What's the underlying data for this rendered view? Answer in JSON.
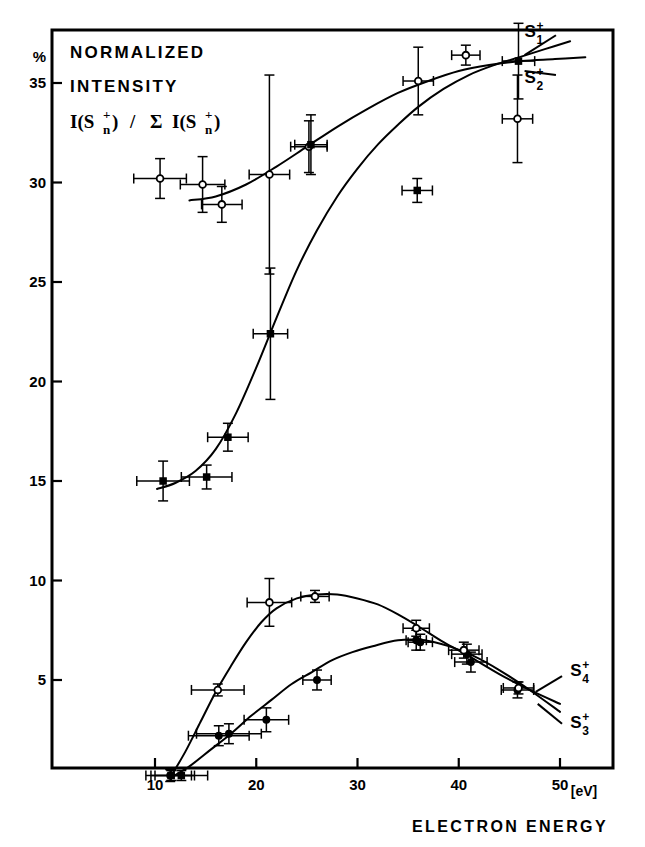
{
  "figure": {
    "heading_line1": "NORMALIZED",
    "heading_line2": "INTENSITY",
    "formula": "I(Sn+) / Σ I(Sn+)",
    "formula_parts": {
      "open": "I(S",
      "sub": "n",
      "sup": "+",
      "close": ")",
      "slash": "/",
      "sigma": "Σ"
    },
    "y_unit": "%",
    "x_unit": "[eV]",
    "x_title": "ELECTRON ENERGY"
  },
  "axes": {
    "x_ticks": [
      "10",
      "20",
      "30",
      "40",
      "50"
    ],
    "x_tick_values": [
      10,
      20,
      30,
      40,
      50
    ],
    "y_ticks": [
      "5",
      "10",
      "15",
      "20",
      "25",
      "30",
      "35"
    ],
    "y_tick_values": [
      5,
      10,
      15,
      20,
      25,
      30,
      35
    ],
    "xlim": [
      3.6,
      55.4
    ],
    "ylim": [
      -0.2,
      37.0
    ]
  },
  "chart_data": {
    "type": "scatter",
    "xlabel": "ELECTRON ENERGY [eV]",
    "ylabel": "%",
    "xlim": [
      3.6,
      55.4
    ],
    "ylim": [
      -0.2,
      37.0
    ],
    "grid": false,
    "legend": "inline-curve-labels",
    "series": [
      {
        "name": "S1+",
        "label": "S₁⁺",
        "marker": "filled-circle",
        "label_pos": {
          "x": 46.5,
          "y": 37.3
        },
        "points": [
          {
            "x": 11.5,
            "y": 0.2,
            "xerr": 2.4,
            "yerr": 0.3
          },
          {
            "x": 16.3,
            "y": 2.2,
            "xerr": 3.0,
            "yerr": 0.5
          },
          {
            "x": 17.3,
            "y": 2.3,
            "xerr": 3.2,
            "yerr": 0.5
          },
          {
            "x": 21.0,
            "y": 3.0,
            "xerr": 2.2,
            "yerr": 0.6
          },
          {
            "x": 26.0,
            "y": 5.0,
            "xerr": 1.4,
            "yerr": 0.5
          },
          {
            "x": 35.8,
            "y": 7.0,
            "xerr": 1.0,
            "yerr": 0.5
          },
          {
            "x": 36.2,
            "y": 6.9,
            "xerr": 1.2,
            "yerr": 0.4
          },
          {
            "x": 40.8,
            "y": 6.3,
            "xerr": 1.5,
            "yerr": 0.5
          },
          {
            "x": 41.2,
            "y": 5.9,
            "xerr": 1.6,
            "yerr": 0.5
          },
          {
            "x": 45.8,
            "y": 4.5,
            "xerr": 1.6,
            "yerr": 0.4
          }
        ]
      },
      {
        "name": "S2+",
        "label": "S₂⁺",
        "marker": "open-circle",
        "label_pos": {
          "x": 46.5,
          "y": 35.0
        },
        "points": [
          {
            "x": 10.5,
            "y": 30.2,
            "xerr": 2.6,
            "yerr": 1.0
          },
          {
            "x": 14.7,
            "y": 29.9,
            "xerr": 2.2,
            "yerr": 1.4
          },
          {
            "x": 16.6,
            "y": 28.9,
            "xerr": 2.0,
            "yerr": 0.9
          },
          {
            "x": 21.3,
            "y": 30.4,
            "xerr": 2.0,
            "yerr": 5.0
          },
          {
            "x": 25.2,
            "y": 31.8,
            "xerr": 1.8,
            "yerr": 1.3
          },
          {
            "x": 36.0,
            "y": 35.1,
            "xerr": 1.5,
            "yerr": 1.7
          },
          {
            "x": 40.7,
            "y": 36.4,
            "xerr": 1.4,
            "yerr": 0.5
          },
          {
            "x": 45.8,
            "y": 33.2,
            "xerr": 1.5,
            "yerr": 2.2
          }
        ]
      },
      {
        "name": "S3+",
        "label": "S₃⁺",
        "marker": "filled-square",
        "label_pos": {
          "x": 51.0,
          "y": 2.6
        },
        "points": [
          {
            "x": 11.6,
            "y": 0.2,
            "xerr": 2.0,
            "yerr": 0.25
          },
          {
            "x": 12.6,
            "y": 0.2,
            "xerr": 2.6,
            "yerr": 0.25
          },
          {
            "x": 15.1,
            "y": 15.2,
            "xerr": 2.5,
            "yerr": 0.6
          },
          {
            "x": 10.8,
            "y": 15.0,
            "xerr": 2.6,
            "yerr": 1.0
          },
          {
            "x": 17.2,
            "y": 17.2,
            "xerr": 2.0,
            "yerr": 0.7
          },
          {
            "x": 21.4,
            "y": 22.4,
            "xerr": 1.7,
            "yerr": 3.3
          },
          {
            "x": 25.4,
            "y": 31.9,
            "xerr": 1.6,
            "yerr": 1.5
          },
          {
            "x": 35.9,
            "y": 29.6,
            "xerr": 1.5,
            "yerr": 0.6
          },
          {
            "x": 45.9,
            "y": 36.1,
            "xerr": 1.6,
            "yerr": 1.9
          }
        ]
      },
      {
        "name": "S4+",
        "label": "S₄⁺",
        "marker": "open-circle",
        "label_pos": {
          "x": 51.0,
          "y": 5.2
        },
        "points": [
          {
            "x": 16.2,
            "y": 4.5,
            "xerr": 2.6,
            "yerr": 0.3
          },
          {
            "x": 21.3,
            "y": 8.9,
            "xerr": 2.2,
            "yerr": 1.2
          },
          {
            "x": 25.8,
            "y": 9.2,
            "xerr": 1.4,
            "yerr": 0.3
          },
          {
            "x": 35.8,
            "y": 7.6,
            "xerr": 1.3,
            "yerr": 0.4
          },
          {
            "x": 40.5,
            "y": 6.5,
            "xerr": 1.5,
            "yerr": 0.4
          },
          {
            "x": 45.9,
            "y": 4.6,
            "xerr": 1.5,
            "yerr": 0.3
          }
        ]
      }
    ],
    "curves": [
      {
        "name": "S2+-upper-curve",
        "note": "upper saturating curve rising 29 -> 36.5",
        "path": [
          {
            "x": 13.4,
            "y": 29.1
          },
          {
            "x": 16.0,
            "y": 29.3
          },
          {
            "x": 19.0,
            "y": 29.9
          },
          {
            "x": 22.0,
            "y": 30.8
          },
          {
            "x": 25.0,
            "y": 31.8
          },
          {
            "x": 28.0,
            "y": 32.8
          },
          {
            "x": 31.0,
            "y": 33.7
          },
          {
            "x": 34.0,
            "y": 34.5
          },
          {
            "x": 37.0,
            "y": 35.1
          },
          {
            "x": 40.0,
            "y": 35.6
          },
          {
            "x": 43.0,
            "y": 35.9
          },
          {
            "x": 46.2,
            "y": 36.1
          },
          {
            "x": 49.5,
            "y": 36.2
          },
          {
            "x": 52.5,
            "y": 36.3
          }
        ]
      },
      {
        "name": "S1+-sigmoid-curve",
        "note": "sigmoid rising 14.8 -> past 36 crossing at ~46 eV",
        "path": [
          {
            "x": 10.2,
            "y": 14.6
          },
          {
            "x": 12.0,
            "y": 14.9
          },
          {
            "x": 14.0,
            "y": 15.5
          },
          {
            "x": 16.0,
            "y": 16.6
          },
          {
            "x": 18.0,
            "y": 18.4
          },
          {
            "x": 20.0,
            "y": 20.7
          },
          {
            "x": 22.0,
            "y": 23.2
          },
          {
            "x": 24.0,
            "y": 25.6
          },
          {
            "x": 26.0,
            "y": 27.6
          },
          {
            "x": 28.0,
            "y": 29.3
          },
          {
            "x": 30.0,
            "y": 30.7
          },
          {
            "x": 32.0,
            "y": 31.9
          },
          {
            "x": 34.0,
            "y": 32.9
          },
          {
            "x": 36.0,
            "y": 33.8
          },
          {
            "x": 38.5,
            "y": 34.7
          },
          {
            "x": 41.0,
            "y": 35.4
          },
          {
            "x": 43.5,
            "y": 35.9
          },
          {
            "x": 46.0,
            "y": 36.3
          },
          {
            "x": 48.5,
            "y": 36.7
          },
          {
            "x": 51.0,
            "y": 37.1
          }
        ]
      },
      {
        "name": "S4+-hump-curve",
        "note": "lower hump peaking ~9.3 at 27 eV",
        "path": [
          {
            "x": 11.5,
            "y": 0.1
          },
          {
            "x": 13.0,
            "y": 1.4
          },
          {
            "x": 14.5,
            "y": 2.9
          },
          {
            "x": 16.0,
            "y": 4.4
          },
          {
            "x": 17.5,
            "y": 5.7
          },
          {
            "x": 19.0,
            "y": 6.9
          },
          {
            "x": 20.5,
            "y": 7.9
          },
          {
            "x": 22.0,
            "y": 8.6
          },
          {
            "x": 24.0,
            "y": 9.1
          },
          {
            "x": 26.0,
            "y": 9.3
          },
          {
            "x": 28.0,
            "y": 9.3
          },
          {
            "x": 30.0,
            "y": 9.1
          },
          {
            "x": 32.0,
            "y": 8.8
          },
          {
            "x": 34.0,
            "y": 8.3
          },
          {
            "x": 36.0,
            "y": 7.7
          },
          {
            "x": 38.5,
            "y": 6.9
          },
          {
            "x": 41.0,
            "y": 6.2
          },
          {
            "x": 44.0,
            "y": 5.3
          },
          {
            "x": 47.0,
            "y": 4.5
          },
          {
            "x": 50.0,
            "y": 3.8
          }
        ]
      },
      {
        "name": "S3+-hump-curve",
        "note": "lowest hump peaking ~7.0 at 35 eV",
        "path": [
          {
            "x": 11.6,
            "y": 0.1
          },
          {
            "x": 13.5,
            "y": 0.7
          },
          {
            "x": 15.5,
            "y": 1.5
          },
          {
            "x": 17.5,
            "y": 2.3
          },
          {
            "x": 19.5,
            "y": 3.2
          },
          {
            "x": 21.5,
            "y": 4.0
          },
          {
            "x": 23.5,
            "y": 4.8
          },
          {
            "x": 25.5,
            "y": 5.4
          },
          {
            "x": 27.5,
            "y": 6.0
          },
          {
            "x": 29.5,
            "y": 6.4
          },
          {
            "x": 31.5,
            "y": 6.7
          },
          {
            "x": 34.0,
            "y": 7.0
          },
          {
            "x": 36.5,
            "y": 7.0
          },
          {
            "x": 39.0,
            "y": 6.7
          },
          {
            "x": 41.5,
            "y": 6.2
          },
          {
            "x": 44.0,
            "y": 5.5
          },
          {
            "x": 47.0,
            "y": 4.5
          },
          {
            "x": 50.0,
            "y": 3.4
          }
        ]
      }
    ],
    "leaders": [
      {
        "name": "S1+-leader",
        "from": {
          "x": 46.5,
          "y": 36.4
        },
        "to": {
          "x": 49.6,
          "y": 37.4
        }
      },
      {
        "name": "S2+-leader",
        "from": {
          "x": 46.5,
          "y": 35.6
        },
        "to": {
          "x": 49.6,
          "y": 35.4
        }
      },
      {
        "name": "S4+-leader",
        "from": {
          "x": 47.6,
          "y": 4.4
        },
        "to": {
          "x": 50.2,
          "y": 5.2
        }
      },
      {
        "name": "S3+-leader",
        "from": {
          "x": 47.8,
          "y": 3.8
        },
        "to": {
          "x": 50.2,
          "y": 2.8
        }
      }
    ]
  }
}
